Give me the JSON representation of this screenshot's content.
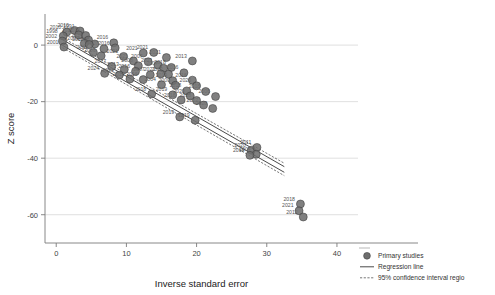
{
  "chart_data": {
    "type": "scatter",
    "title": "",
    "xlabel": "Inverse standard error",
    "ylabel": "Z score",
    "xlim": [
      -1.6,
      43.0
    ],
    "ylim": [
      -70.0,
      11.0
    ],
    "xticks": [
      0,
      10,
      20,
      30,
      40
    ],
    "xticklabels": [
      "0",
      "10",
      "20",
      "30",
      "40"
    ],
    "yticks": [
      0,
      -20,
      -40,
      -60
    ],
    "yticklabels": [
      "0",
      "-20",
      "-40",
      "-60"
    ],
    "grid": "horizontal",
    "legend_position": "bottom-right",
    "legend": [
      {
        "key": "primary-studies",
        "label": "Primary studies",
        "symbol": "filled-circle"
      },
      {
        "key": "regression-line",
        "label": "Regression line",
        "symbol": "solid-line"
      },
      {
        "key": "confidence-region",
        "label": "95% confidence interval regio",
        "symbol": "dashed-line"
      }
    ],
    "series": [
      {
        "name": "Primary studies",
        "marker": "circle",
        "color": "#6e6e6e",
        "points": [
          {
            "x": 1.5,
            "y": 4.6,
            "label": "2010"
          },
          {
            "x": 2.6,
            "y": 5.2,
            "label": "2010"
          },
          {
            "x": 3.4,
            "y": 5.0,
            "label": "1991"
          },
          {
            "x": 1.0,
            "y": 3.2,
            "label": "1998"
          },
          {
            "x": 3.2,
            "y": 3.6,
            "label": "2017"
          },
          {
            "x": 4.2,
            "y": 3.4,
            "label": "2018"
          },
          {
            "x": 0.9,
            "y": 1.4,
            "label": "2002"
          },
          {
            "x": 4.6,
            "y": 1.8,
            "label": "2014"
          },
          {
            "x": 1.1,
            "y": -0.7,
            "label": "2001"
          },
          {
            "x": 5.5,
            "y": 0.4,
            "label": "1990"
          },
          {
            "x": 4.0,
            "y": 0.6,
            "label": "2003"
          },
          {
            "x": 4.7,
            "y": 0.2,
            "label": "2008"
          },
          {
            "x": 8.2,
            "y": 0.8,
            "label": "2016"
          },
          {
            "x": 6.8,
            "y": -1.3,
            "label": "2007"
          },
          {
            "x": 8.4,
            "y": -1.0,
            "label": "2016"
          },
          {
            "x": 5.3,
            "y": -2.6,
            "label": "2011"
          },
          {
            "x": 6.4,
            "y": -3.8,
            "label": "2006"
          },
          {
            "x": 9.6,
            "y": -4.0,
            "label": "2021"
          },
          {
            "x": 12.4,
            "y": -2.8,
            "label": "2021"
          },
          {
            "x": 13.9,
            "y": -2.6,
            "label": "2021"
          },
          {
            "x": 15.7,
            "y": -4.4,
            "label": "2021"
          },
          {
            "x": 11.0,
            "y": -5.6,
            "label": "2021"
          },
          {
            "x": 13.1,
            "y": -5.9,
            "label": "2007"
          },
          {
            "x": 19.4,
            "y": -5.6,
            "label": "2013"
          },
          {
            "x": 11.7,
            "y": -7.3,
            "label": "2008"
          },
          {
            "x": 14.5,
            "y": -7.1,
            "label": "2021"
          },
          {
            "x": 7.9,
            "y": -7.6,
            "label": "2017"
          },
          {
            "x": 9.7,
            "y": -8.6,
            "label": "2013"
          },
          {
            "x": 15.3,
            "y": -8.2,
            "label": "2007"
          },
          {
            "x": 16.4,
            "y": -7.9,
            "label": "2018"
          },
          {
            "x": 11.3,
            "y": -9.3,
            "label": "2016"
          },
          {
            "x": 6.9,
            "y": -10.0,
            "label": "2024"
          },
          {
            "x": 9.0,
            "y": -10.6,
            "label": "2021"
          },
          {
            "x": 13.4,
            "y": -10.5,
            "label": "2007"
          },
          {
            "x": 14.9,
            "y": -10.2,
            "label": "2021"
          },
          {
            "x": 16.0,
            "y": -10.3,
            "label": "2022"
          },
          {
            "x": 18.2,
            "y": -9.8,
            "label": "2016"
          },
          {
            "x": 10.5,
            "y": -12.0,
            "label": "2019"
          },
          {
            "x": 12.4,
            "y": -12.2,
            "label": "2016"
          },
          {
            "x": 16.6,
            "y": -12.6,
            "label": "2019"
          },
          {
            "x": 19.4,
            "y": -12.4,
            "label": "2016"
          },
          {
            "x": 15.0,
            "y": -14.0,
            "label": "2004"
          },
          {
            "x": 17.0,
            "y": -14.2,
            "label": "2000"
          },
          {
            "x": 20.0,
            "y": -14.4,
            "label": "2020"
          },
          {
            "x": 18.6,
            "y": -16.2,
            "label": "2018"
          },
          {
            "x": 21.3,
            "y": -16.4,
            "label": "2018"
          },
          {
            "x": 13.6,
            "y": -17.3,
            "label": "2018"
          },
          {
            "x": 16.6,
            "y": -17.6,
            "label": "2019"
          },
          {
            "x": 19.1,
            "y": -18.0,
            "label": "2020"
          },
          {
            "x": 17.8,
            "y": -19.4,
            "label": "2018"
          },
          {
            "x": 20.0,
            "y": -19.6,
            "label": "2018"
          },
          {
            "x": 22.7,
            "y": -18.2,
            "label": "2006"
          },
          {
            "x": 21.0,
            "y": -21.2,
            "label": "2022"
          },
          {
            "x": 22.3,
            "y": -22.4,
            "label": "2020"
          },
          {
            "x": 17.6,
            "y": -25.4,
            "label": "2019"
          },
          {
            "x": 19.8,
            "y": -26.6,
            "label": "2019"
          },
          {
            "x": 27.8,
            "y": -37.2,
            "label": "2020"
          },
          {
            "x": 28.6,
            "y": -36.2,
            "label": "2011"
          },
          {
            "x": 28.5,
            "y": -38.6,
            "label": "2004"
          },
          {
            "x": 27.6,
            "y": -39.0,
            "label": "2018"
          },
          {
            "x": 34.8,
            "y": -56.2,
            "label": "2018"
          },
          {
            "x": 34.6,
            "y": -58.6,
            "label": "2021"
          },
          {
            "x": 35.2,
            "y": -60.8,
            "label": "2012"
          }
        ]
      }
    ],
    "regression": {
      "name": "Regression line",
      "x_start": 0.9,
      "x_end": 32.5,
      "y_start": 0.9,
      "y_end": -44.0
    },
    "confidence_band": {
      "name": "95% confidence interval region",
      "upper": {
        "x_start": 0.9,
        "y_start": 2.6,
        "x_end": 32.5,
        "y_end": -41.8
      },
      "lower": {
        "x_start": 0.9,
        "y_start": -0.9,
        "x_end": 32.5,
        "y_end": -46.2
      }
    }
  }
}
